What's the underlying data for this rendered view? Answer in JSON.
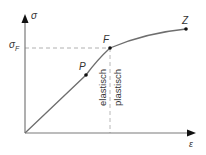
{
  "diagram": {
    "y_axis": {
      "label": "σ"
    },
    "x_axis": {
      "label": "ε"
    },
    "yield_stress": {
      "symbol": "σ",
      "subscript": "F"
    },
    "points": [
      {
        "id": "P",
        "label": "P"
      },
      {
        "id": "F",
        "label": "F"
      },
      {
        "id": "Z",
        "label": "Z"
      }
    ],
    "regions": {
      "left": "elastisch",
      "right": "plastisch"
    },
    "colors": {
      "axis": "#7a7a7a",
      "curve": "#6e6e6e",
      "dashed": "#b0b0b0",
      "point": "#111111",
      "text": "#333333"
    }
  }
}
